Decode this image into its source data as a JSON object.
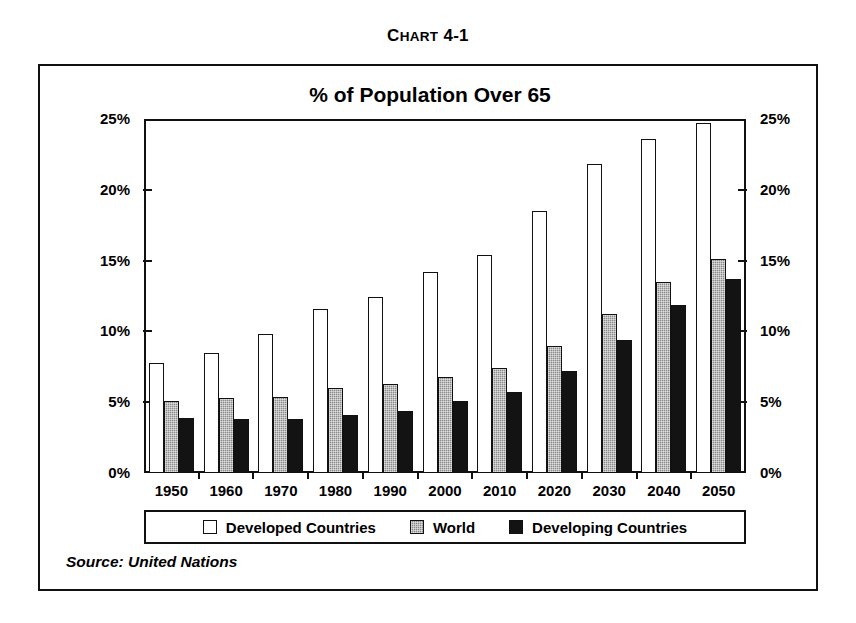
{
  "figure": {
    "caption_lead": "C",
    "caption_rest": "HART",
    "caption_number": "4-1",
    "caption_full": "CHART 4-1",
    "source_note": "Source: United Nations"
  },
  "colors": {
    "developed": "#ffffff",
    "world": "#8a8a8a",
    "developing": "#131313",
    "axis": "#111111",
    "background": "#ffffff"
  },
  "legend": {
    "position": "bottom",
    "entries": [
      {
        "label": "Developed Countries",
        "swatch": "developed"
      },
      {
        "label": "World",
        "swatch": "world"
      },
      {
        "label": "Developing Countries",
        "swatch": "developing"
      }
    ]
  },
  "chart_data": {
    "type": "bar",
    "title": "% of Population Over 65",
    "xlabel": "",
    "ylabel": "",
    "ylim": [
      0,
      25
    ],
    "yticks": [
      0,
      5,
      10,
      15,
      20,
      25
    ],
    "ytick_labels": [
      "0%",
      "5%",
      "10%",
      "15%",
      "20%",
      "25%"
    ],
    "y_axis_both_sides": true,
    "grid": false,
    "legend_position": "bottom",
    "categories": [
      "1950",
      "1960",
      "1970",
      "1980",
      "1990",
      "2000",
      "2010",
      "2020",
      "2030",
      "2040",
      "2050"
    ],
    "series": [
      {
        "name": "Developed Countries",
        "values": [
          7.8,
          8.5,
          9.8,
          11.6,
          12.4,
          14.2,
          15.4,
          18.5,
          21.8,
          23.6,
          24.7
        ]
      },
      {
        "name": "World",
        "values": [
          5.1,
          5.3,
          5.4,
          6.0,
          6.3,
          6.8,
          7.4,
          9.0,
          11.2,
          13.5,
          15.1
        ]
      },
      {
        "name": "Developing Countries",
        "values": [
          3.9,
          3.8,
          3.8,
          4.1,
          4.4,
          5.1,
          5.7,
          7.2,
          9.4,
          11.9,
          13.7
        ]
      }
    ]
  }
}
